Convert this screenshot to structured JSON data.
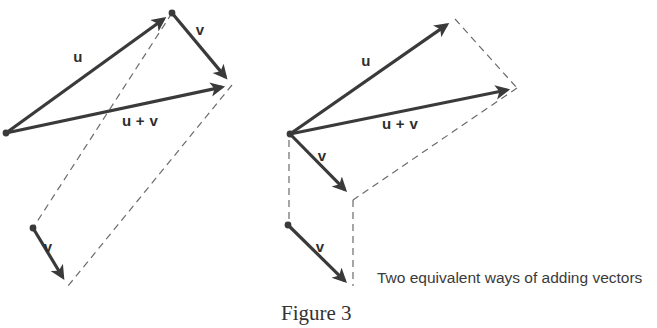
{
  "figure": {
    "number_label": "Figure 3",
    "caption": "Two equivalent ways of adding vectors",
    "ghost_top_text": "",
    "colors": {
      "solid_vector": "#3a3a3a",
      "dashed_guide": "#6b6b6b",
      "label_text": "#2e2e2e",
      "caption_text": "#3a3a3a",
      "figure_number_text": "#333333",
      "background": "#ffffff"
    },
    "stroke_widths": {
      "solid_vector": 3.2,
      "dashed_guide": 1.2
    },
    "dash_pattern": "7 5"
  },
  "diagrams": [
    {
      "id": "parallelogram-law",
      "name": "left-diagram",
      "description": "Parallelogram rule for vector addition",
      "points": {
        "origin": [
          6,
          133
        ],
        "u_tip": [
          172,
          13
        ],
        "sum_tip": [
          232,
          85
        ],
        "v_start_lower": [
          33,
          228
        ],
        "v_tip_lower": [
          68,
          286
        ]
      },
      "vectors": [
        {
          "name": "u",
          "label": "u",
          "from": [
            6,
            133
          ],
          "to": [
            172,
            13
          ],
          "label_pos": [
            78,
            62
          ],
          "dot_at_start": true,
          "dot_at_end": true
        },
        {
          "name": "v",
          "label": "v",
          "from": [
            172,
            13
          ],
          "to": [
            232,
            85
          ],
          "label_pos": [
            200,
            35
          ],
          "dot_at_start": false,
          "dot_at_end": false
        },
        {
          "name": "u_plus_v",
          "label": "u + v",
          "from": [
            6,
            133
          ],
          "to": [
            232,
            85
          ],
          "label_pos": [
            140,
            126
          ],
          "dot_at_start": false,
          "dot_at_end": false
        },
        {
          "name": "v_translated",
          "label": "v",
          "from": [
            33,
            228
          ],
          "to": [
            68,
            286
          ],
          "label_pos": [
            48,
            252
          ],
          "dot_at_start": true,
          "dot_at_end": false
        }
      ],
      "guides": [
        {
          "name": "guide-u-tip-to-v-start",
          "from": [
            172,
            13
          ],
          "to": [
            33,
            228
          ]
        },
        {
          "name": "guide-sum-tip-to-v-tip",
          "from": [
            232,
            85
          ],
          "to": [
            68,
            286
          ]
        }
      ]
    },
    {
      "id": "triangle-law",
      "name": "right-diagram",
      "description": "Head-to-tail (triangle) rule for vector addition",
      "points": {
        "origin": [
          290,
          134
        ],
        "u_tip": [
          455,
          19
        ],
        "sum_tip": [
          517,
          88
        ],
        "v_tip_upper": [
          352,
          197
        ],
        "v_start_lower": [
          288,
          225
        ],
        "v_tip_lower": [
          352,
          288
        ]
      },
      "vectors": [
        {
          "name": "u",
          "label": "u",
          "from": [
            290,
            134
          ],
          "to": [
            455,
            19
          ],
          "label_pos": [
            366,
            66
          ],
          "dot_at_start": true,
          "dot_at_end": false
        },
        {
          "name": "u_plus_v",
          "label": "u + v",
          "from": [
            290,
            134
          ],
          "to": [
            517,
            88
          ],
          "label_pos": [
            400,
            129
          ],
          "dot_at_start": false,
          "dot_at_end": false
        },
        {
          "name": "v_upper",
          "label": "v",
          "from": [
            290,
            134
          ],
          "to": [
            352,
            197
          ],
          "label_pos": [
            322,
            161
          ],
          "dot_at_start": false,
          "dot_at_end": false
        },
        {
          "name": "v_lower",
          "label": "v",
          "from": [
            288,
            225
          ],
          "to": [
            352,
            288
          ],
          "label_pos": [
            320,
            252
          ],
          "dot_at_start": true,
          "dot_at_end": false
        }
      ],
      "guides": [
        {
          "name": "guide-vertical-left",
          "from": [
            289,
            140
          ],
          "to": [
            289,
            222
          ]
        },
        {
          "name": "guide-vertical-mid",
          "from": [
            353,
            200
          ],
          "to": [
            353,
            286
          ]
        },
        {
          "name": "guide-u-tip-to-sum-tip",
          "from": [
            455,
            19
          ],
          "to": [
            517,
            88
          ]
        },
        {
          "name": "guide-sum-tip-to-v-tip",
          "from": [
            517,
            88
          ],
          "to": [
            353,
            200
          ]
        }
      ]
    }
  ],
  "caption_block": {
    "note_pos": [
      377,
      283
    ],
    "figure_number_pos": [
      281,
      320
    ]
  }
}
